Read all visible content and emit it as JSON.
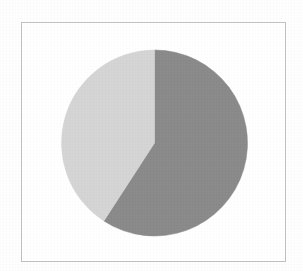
{
  "figure": {
    "title": "",
    "background_color": "#ffffff",
    "frame_color": "#c2c2c2",
    "frame": {
      "x": 21,
      "y": 22,
      "width": 265,
      "height": 240
    }
  },
  "chart_data": {
    "type": "pie",
    "title": "",
    "subtitle": "",
    "xlabel": "",
    "ylabel": "",
    "grid": false,
    "legend": "none",
    "labels_shown": false,
    "start_angle_deg": 0,
    "direction": "clockwise",
    "center": {
      "cx": 154.5,
      "cy": 143
    },
    "radius": 93,
    "categories": [
      "Slice 1",
      "Slice 2"
    ],
    "values": [
      59,
      41
    ],
    "percentages": [
      "59%",
      "41%"
    ],
    "colors": [
      "#8a8a8a",
      "#d5d5d5"
    ],
    "slices": [
      {
        "name": "Slice 1",
        "value": 59,
        "percent": "59%",
        "color": "#8a8a8a",
        "start_angle_deg": 0,
        "end_angle_deg": 213
      },
      {
        "name": "Slice 2",
        "value": 41,
        "percent": "41%",
        "color": "#d5d5d5",
        "start_angle_deg": 213,
        "end_angle_deg": 360
      }
    ]
  },
  "accessibility": {
    "chart_description": "Pie chart with two gray slices"
  }
}
